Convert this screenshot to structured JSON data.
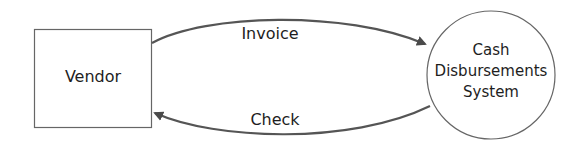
{
  "diagram": {
    "type": "data-flow",
    "nodes": [
      {
        "id": "vendor",
        "label": "Vendor",
        "shape": "rectangle"
      },
      {
        "id": "cds",
        "label_lines": [
          "Cash",
          "Disbursements",
          "System"
        ],
        "shape": "circle"
      }
    ],
    "edges": [
      {
        "from": "vendor",
        "to": "cds",
        "label": "Invoice"
      },
      {
        "from": "cds",
        "to": "vendor",
        "label": "Check"
      }
    ],
    "colors": {
      "stroke": "#555555",
      "arrow": "#4a4a4a",
      "text": "#1e1e1e",
      "background": "#ffffff"
    }
  }
}
